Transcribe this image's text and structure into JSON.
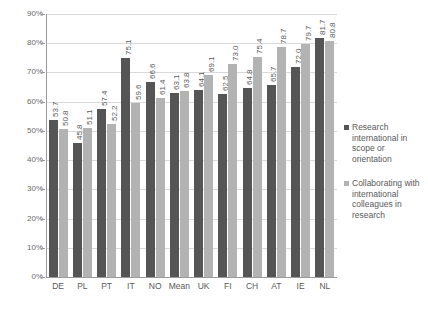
{
  "chart_data": {
    "type": "bar",
    "title": "",
    "subtitle": "",
    "xlabel": "",
    "ylabel": "",
    "ylim": [
      0,
      90
    ],
    "ytick_labels": [
      "0%",
      "10%",
      "20%",
      "30%",
      "40%",
      "50%",
      "60%",
      "70%",
      "80%",
      "90%"
    ],
    "ytick_values": [
      0,
      10,
      20,
      30,
      40,
      50,
      60,
      70,
      80,
      90
    ],
    "grid": true,
    "legend_position": "right",
    "categories": [
      "DE",
      "PL",
      "PT",
      "IT",
      "NO",
      "Mean",
      "UK",
      "FI",
      "CH",
      "AT",
      "IE",
      "NL"
    ],
    "series": [
      {
        "name": "Research international in scope or orientation",
        "color": "#555555",
        "values": [
          53.7,
          45.8,
          57.4,
          75.1,
          66.6,
          63.1,
          64.1,
          62.5,
          64.8,
          65.7,
          72.0,
          81.7
        ],
        "labels": [
          "53.7",
          "45.8",
          "57.4",
          "75.1",
          "66.6",
          "63.1",
          "64.1",
          "62.5",
          "64.8",
          "65.7",
          "72.0",
          "81.7"
        ]
      },
      {
        "name": "Collaborating with international colleagues in research",
        "color": "#b3b3b3",
        "values": [
          50.8,
          51.1,
          52.2,
          59.6,
          61.4,
          63.8,
          69.1,
          73.0,
          75.4,
          78.7,
          79.7,
          80.8
        ],
        "labels": [
          "50.8",
          "51.1",
          "52.2",
          "59.6",
          "61.4",
          "63.8",
          "69.1",
          "73.0",
          "75.4",
          "78.7",
          "79.7",
          "80.8"
        ]
      }
    ]
  },
  "legend": {
    "entries": [
      {
        "label": "Research international in scope or orientation",
        "color": "#555555"
      },
      {
        "label": "Collaborating with international colleagues in research",
        "color": "#b3b3b3"
      }
    ]
  }
}
